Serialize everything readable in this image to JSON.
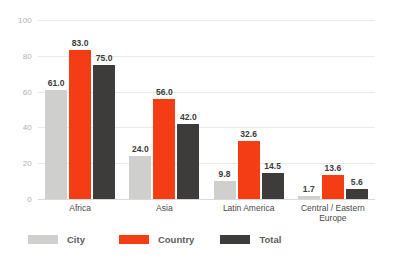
{
  "chart_data": {
    "type": "bar",
    "title": "",
    "subtitle": "",
    "xlabel": "",
    "ylabel": "",
    "ylim": [
      0,
      100
    ],
    "yticks": [
      "0",
      "20",
      "40",
      "60",
      "80",
      "100"
    ],
    "grid": true,
    "legend_position": "bottom-left",
    "categories": [
      "Africa",
      "Asia",
      "Latin America",
      "Central / Eastern\nEurope"
    ],
    "series": [
      {
        "name": "City",
        "color": "#cfcfcd",
        "values": [
          61.0,
          24.0,
          9.8,
          1.7
        ],
        "labels": [
          "61.0",
          "24.0",
          "9.8",
          "1.7"
        ]
      },
      {
        "name": "Country",
        "color": "#f43c15",
        "values": [
          83.0,
          56.0,
          32.6,
          13.6
        ],
        "labels": [
          "83.0",
          "56.0",
          "32.6",
          "13.6"
        ]
      },
      {
        "name": "Total",
        "color": "#3e3c3a",
        "values": [
          75.0,
          42.0,
          14.5,
          5.6
        ],
        "labels": [
          "75.0",
          "42.0",
          "14.5",
          "5.6"
        ]
      }
    ]
  },
  "axis": {
    "tick_color": "#b4b1ae",
    "gridline_color": "#e9e9e9",
    "baseline_color": "#d9d9d9"
  },
  "legend": {
    "items": [
      {
        "label": "City",
        "color": "#cfcfcd"
      },
      {
        "label": "Country",
        "color": "#f43c15"
      },
      {
        "label": "Total",
        "color": "#3e3c3a"
      }
    ]
  }
}
